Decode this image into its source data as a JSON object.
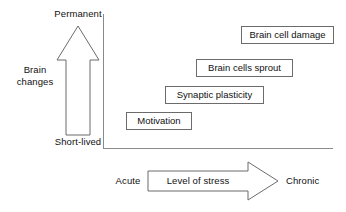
{
  "diagram": {
    "type": "conceptual-staircase-diagram",
    "background_color": "#ffffff",
    "line_color": "#6b6b6b",
    "text_color": "#111111"
  },
  "y_axis": {
    "name": "brain-changes-axis",
    "axis_label_line1": "Brain",
    "axis_label_line2": "changes",
    "top_label": "Permanent",
    "bottom_label": "Short-lived",
    "arrow_direction": "up",
    "arrow_style": "outlined-block-arrow"
  },
  "x_axis": {
    "name": "level-of-stress-axis",
    "axis_label": "Level of stress",
    "left_label": "Acute",
    "right_label": "Chronic",
    "arrow_direction": "right",
    "arrow_style": "outlined-block-arrow"
  },
  "steps": [
    {
      "label": "Motivation",
      "stress_level": "acute",
      "brain_change": "short-lived",
      "order": 1,
      "x": 126,
      "y": 112,
      "width": 66
    },
    {
      "label": "Synaptic plasticity",
      "stress_level": "low-moderate",
      "brain_change": "moderate",
      "order": 2,
      "x": 165,
      "y": 86,
      "width": 99
    },
    {
      "label": "Brain cells sprout",
      "stress_level": "moderate-high",
      "brain_change": "longer-lasting",
      "order": 3,
      "x": 196,
      "y": 59,
      "width": 97
    },
    {
      "label": "Brain cell damage",
      "stress_level": "chronic",
      "brain_change": "permanent",
      "order": 4,
      "x": 241,
      "y": 26,
      "width": 93
    }
  ]
}
